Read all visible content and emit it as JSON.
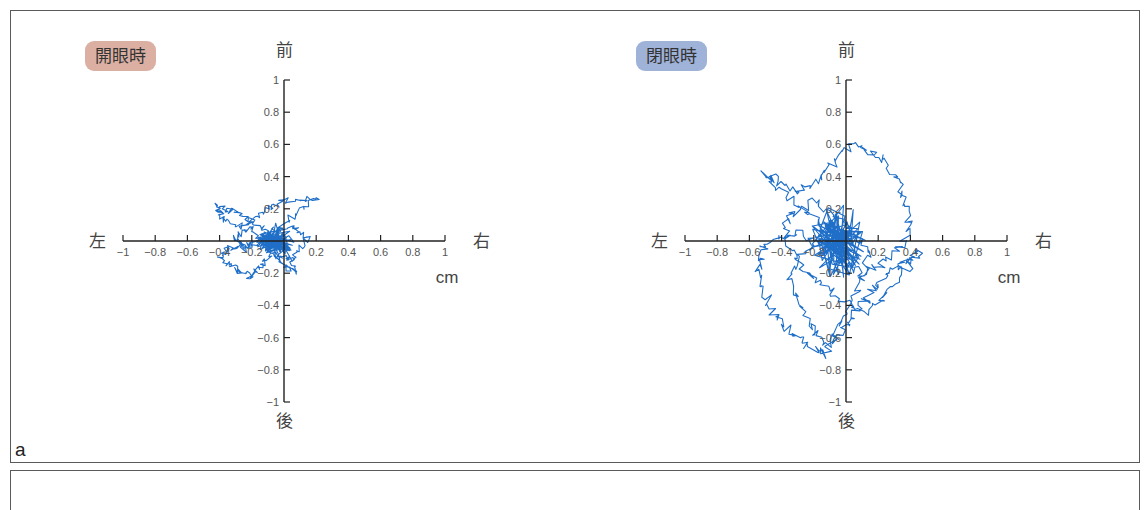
{
  "figure": {
    "panel_a_label": "a",
    "direction_labels": {
      "front": "前",
      "back": "後",
      "left": "左",
      "right": "右"
    },
    "unit": "cm"
  },
  "colors": {
    "eyes_open_badge": "#dbb0a2",
    "eyes_closed_badge": "#9fb2d8",
    "trace": "#1f6fc8",
    "axis": "#222222"
  },
  "chart_data": [
    {
      "type": "line",
      "title": "開眼時",
      "subtitle": "Stabilogram (center of pressure sway path), eyes open",
      "xlabel": "cm",
      "x_direction_labels": [
        "左",
        "右"
      ],
      "y_direction_labels": [
        "後",
        "前"
      ],
      "xlim": [
        -1,
        1
      ],
      "ylim": [
        -1,
        1
      ],
      "x_ticks": [
        -1,
        -0.8,
        -0.6,
        -0.4,
        -0.2,
        0,
        0.2,
        0.4,
        0.6,
        0.8,
        1
      ],
      "x_tick_labels": [
        "−1",
        "−0.8",
        "−0.6",
        "−0.4",
        "−0.2",
        "",
        "0.2",
        "0.4",
        "0.6",
        "0.8",
        "1"
      ],
      "y_ticks": [
        -1,
        -0.8,
        -0.6,
        -0.4,
        -0.2,
        0,
        0.2,
        0.4,
        0.6,
        0.8,
        1
      ],
      "y_tick_labels": [
        "−1",
        "−0.8",
        "−0.6",
        "−0.4",
        "−0.2",
        "",
        "0.2",
        "0.4",
        "0.6",
        "0.8",
        "1"
      ],
      "grid": false,
      "extent": {
        "x_min": -0.45,
        "x_max": 0.25,
        "y_min": -0.25,
        "y_max": 0.25
      },
      "series": [
        {
          "name": "COP path (eyes open)",
          "x": [
            -0.05,
            -0.15,
            -0.3,
            -0.42,
            -0.38,
            -0.25,
            -0.1,
            0.0,
            0.2,
            0.05,
            -0.1,
            -0.2,
            -0.35,
            -0.4,
            -0.3,
            -0.2,
            -0.15,
            -0.05,
            0.05,
            0.15,
            0.05,
            -0.05,
            -0.15,
            -0.25,
            -0.3,
            -0.2,
            -0.1,
            0.0,
            0.08,
            -0.02
          ],
          "y": [
            0.0,
            0.1,
            0.18,
            0.22,
            0.14,
            0.08,
            0.2,
            0.25,
            0.27,
            0.15,
            0.05,
            -0.02,
            -0.05,
            -0.1,
            -0.18,
            -0.22,
            -0.15,
            -0.08,
            -0.12,
            0.02,
            0.1,
            0.05,
            0.0,
            -0.05,
            0.02,
            0.08,
            -0.05,
            -0.15,
            -0.2,
            0.0
          ]
        }
      ]
    },
    {
      "type": "line",
      "title": "閉眼時",
      "subtitle": "Stabilogram (center of pressure sway path), eyes closed",
      "xlabel": "cm",
      "x_direction_labels": [
        "左",
        "右"
      ],
      "y_direction_labels": [
        "後",
        "前"
      ],
      "xlim": [
        -1,
        1
      ],
      "ylim": [
        -1,
        1
      ],
      "x_ticks": [
        -1,
        -0.8,
        -0.6,
        -0.4,
        -0.2,
        0,
        0.2,
        0.4,
        0.6,
        0.8,
        1
      ],
      "x_tick_labels": [
        "−1",
        "−0.8",
        "−0.6",
        "−0.4",
        "−0.2",
        "",
        "0.2",
        "0.4",
        "0.6",
        "0.8",
        "1"
      ],
      "y_ticks": [
        -1,
        -0.8,
        -0.6,
        -0.4,
        -0.2,
        0,
        0.2,
        0.4,
        0.6,
        0.8,
        1
      ],
      "y_tick_labels": [
        "−1",
        "−0.8",
        "−0.6",
        "−0.4",
        "−0.2",
        "",
        "0.2",
        "0.4",
        "0.6",
        "0.8",
        "1"
      ],
      "grid": false,
      "extent": {
        "x_min": -0.55,
        "x_max": 0.45,
        "y_min": -0.75,
        "y_max": 0.6
      },
      "series": [
        {
          "name": "COP path (eyes closed)",
          "x": [
            0.0,
            -0.2,
            -0.45,
            -0.5,
            -0.3,
            -0.1,
            0.05,
            0.25,
            0.35,
            0.4,
            0.3,
            0.1,
            -0.05,
            -0.3,
            -0.5,
            -0.55,
            -0.45,
            -0.3,
            -0.15,
            0.0,
            0.1,
            0.2,
            0.35,
            0.45,
            0.3,
            0.1,
            -0.1,
            -0.3,
            -0.4,
            -0.2,
            0.0,
            0.15,
            0.05,
            -0.1,
            -0.25,
            -0.35,
            -0.2,
            0.0
          ],
          "y": [
            0.0,
            0.15,
            0.35,
            0.42,
            0.3,
            0.45,
            0.6,
            0.5,
            0.3,
            0.1,
            -0.1,
            -0.2,
            -0.1,
            0.05,
            0.0,
            -0.2,
            -0.45,
            -0.6,
            -0.7,
            -0.55,
            -0.4,
            -0.25,
            -0.15,
            -0.05,
            -0.3,
            -0.45,
            -0.3,
            -0.15,
            0.1,
            0.25,
            0.1,
            -0.05,
            -0.35,
            -0.65,
            -0.5,
            -0.2,
            0.0,
            0.05
          ]
        }
      ]
    }
  ]
}
